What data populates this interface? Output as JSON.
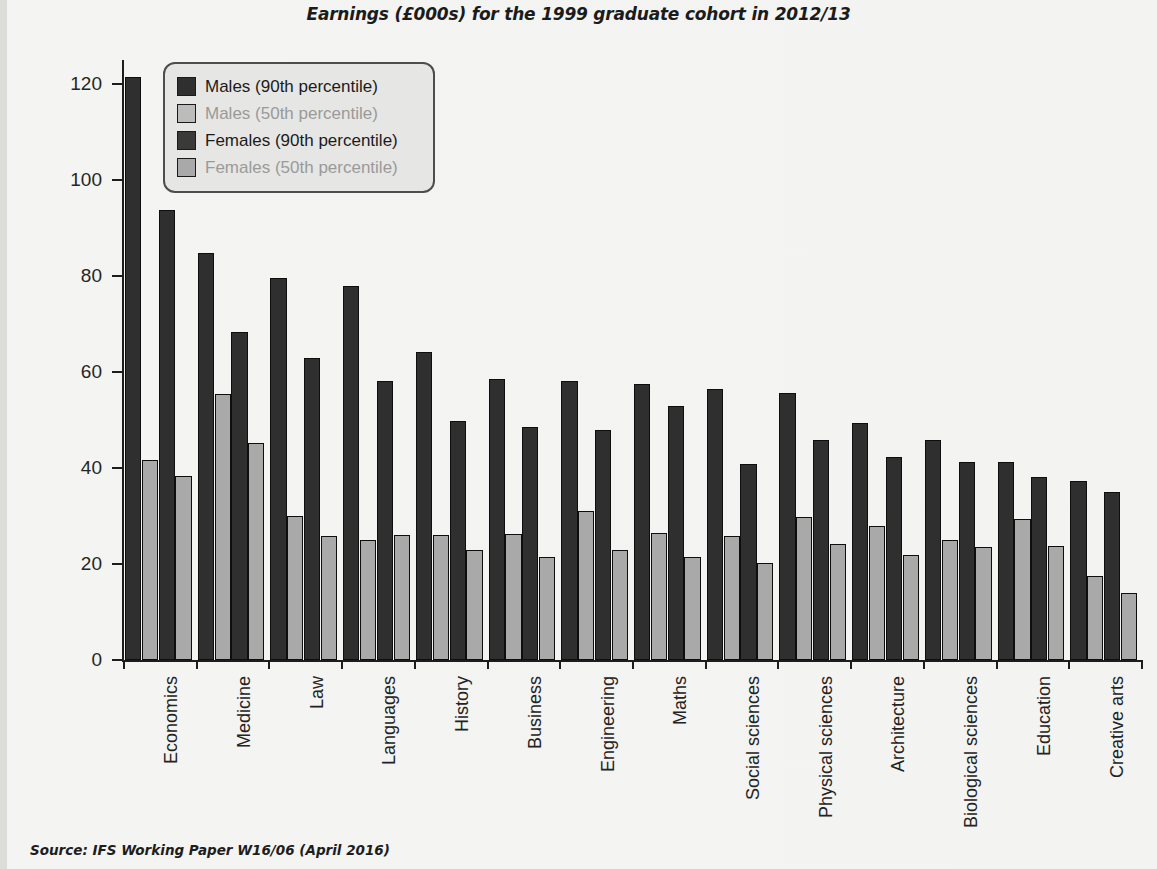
{
  "chart_data": {
    "type": "bar",
    "title": "Earnings (£000s) for the 1999 graduate cohort in 2012/13",
    "xlabel": "",
    "ylabel": "£ per annum (000s)",
    "ylim": [
      0,
      125
    ],
    "yticks": [
      0,
      20,
      40,
      60,
      80,
      100,
      120
    ],
    "grid": false,
    "legend_position": "top-left",
    "source": "Source: IFS Working Paper W16/06 (April 2016)",
    "categories": [
      "Economics",
      "Medicine",
      "Law",
      "Languages",
      "History",
      "Business",
      "Engineering",
      "Maths",
      "Social sciences",
      "Physical sciences",
      "Architecture",
      "Biological sciences",
      "Education",
      "Creative arts"
    ],
    "series": [
      {
        "name": "Males (90th percentile)",
        "color": "#2f2f2f",
        "values": [
          121.5,
          84.8,
          79.5,
          78.0,
          64.2,
          58.5,
          58.2,
          57.4,
          56.5,
          55.6,
          49.3,
          45.8,
          41.2,
          37.2
        ]
      },
      {
        "name": "Males (50th percentile)",
        "color": "#a9a9a9",
        "values": [
          41.7,
          55.4,
          30.1,
          25.1,
          26.1,
          26.2,
          31.0,
          26.5,
          25.8,
          29.7,
          27.9,
          24.9,
          29.3,
          17.4
        ]
      },
      {
        "name": "Females (90th percentile)",
        "color": "#2f2f2f",
        "values": [
          93.8,
          68.4,
          62.9,
          58.1,
          49.8,
          48.6,
          48.0,
          52.9,
          40.8,
          45.9,
          42.3,
          41.3,
          38.1,
          34.9
        ]
      },
      {
        "name": "Females (50th percentile)",
        "color": "#a9a9a9",
        "values": [
          38.3,
          45.3,
          25.8,
          26.1,
          23.0,
          21.4,
          23.0,
          21.4,
          20.2,
          24.2,
          21.8,
          23.5,
          23.8,
          14.0
        ]
      }
    ]
  },
  "legend": {
    "items": [
      {
        "label": "Males (90th percentile)",
        "color": "#2f2f2f",
        "text_color": "#1b1b1b"
      },
      {
        "label": "Males (50th percentile)",
        "color": "#bcbcbc",
        "text_color": "#9a9a9a"
      },
      {
        "label": "Females (90th percentile)",
        "color": "#3a3a3a",
        "text_color": "#1b1b1b"
      },
      {
        "label": "Females (50th percentile)",
        "color": "#a9a9a9",
        "text_color": "#9a9a9a"
      }
    ]
  }
}
